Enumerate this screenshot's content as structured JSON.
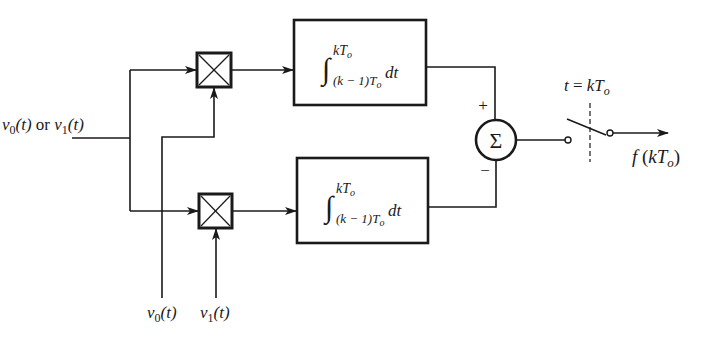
{
  "diagram": {
    "type": "correlation-receiver block diagram",
    "input": {
      "label_main": "v",
      "label_a_sub": "0",
      "label_a_arg": "(t)",
      "label_or": " or ",
      "label_b_sub": "1",
      "label_b_arg": "(t)",
      "full_text": "v0(t) or v1(t)"
    },
    "references": [
      {
        "id": "v0",
        "label_main": "v",
        "label_sub": "0",
        "label_arg": "(t)",
        "full_text": "v0(t)"
      },
      {
        "id": "v1",
        "label_main": "v",
        "label_sub": "1",
        "label_arg": "(t)",
        "full_text": "v1(t)"
      }
    ],
    "multipliers": [
      {
        "id": "mult-top",
        "symbol": "⊠"
      },
      {
        "id": "mult-bottom",
        "symbol": "⊠"
      }
    ],
    "integrators": [
      {
        "id": "integrator-top",
        "upper_limit": "kT",
        "upper_sub": "o",
        "lower_limit": "(k − 1)T",
        "lower_sub": "o",
        "integrand": "dt",
        "full_text": "∫_{(k−1)To}^{kTo} dt"
      },
      {
        "id": "integrator-bottom",
        "upper_limit": "kT",
        "upper_sub": "o",
        "lower_limit": "(k − 1)T",
        "lower_sub": "o",
        "integrand": "dt",
        "full_text": "∫_{(k−1)To}^{kTo} dt"
      }
    ],
    "summer": {
      "symbol": "Σ",
      "plus_sign": "+",
      "minus_sign": "−"
    },
    "sampler": {
      "label_t": "t",
      "label_eq": " = ",
      "label_k": "kT",
      "label_sub": "o",
      "full_text": "t = kTo"
    },
    "output": {
      "label_f": "f",
      "label_open": " (",
      "label_k": "kT",
      "label_sub": "o",
      "label_close": ")",
      "full_text": "f (kTo)"
    },
    "colors": {
      "line": "#1a1a1a",
      "background": "#ffffff"
    }
  }
}
